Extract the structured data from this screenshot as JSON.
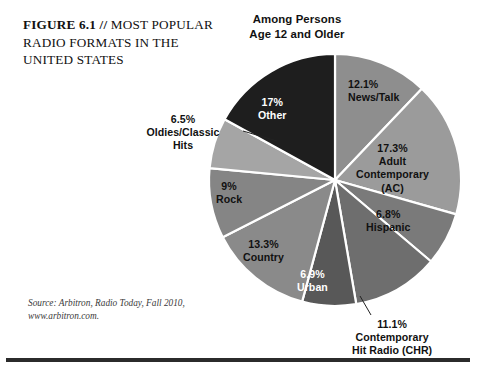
{
  "figure": {
    "title_lead": "FIGURE 6.1 // ",
    "title_rest": "MOST POPULAR RADIO FORMATS IN THE UNITED STATES",
    "subtitle": "Among Persons\nAge 12 and Older",
    "subtitle_line1": "Among Persons",
    "subtitle_line2": "Age 12 and Older",
    "source_line1": "Source: Arbitron, Radio Today, Fall 2010,",
    "source_line2": "www.arbitron.com."
  },
  "labels": {
    "newstalk_pct": "12.1%",
    "newstalk_name": "News/Talk",
    "ac_pct": "17.3%",
    "ac_name1": "Adult",
    "ac_name2": "Contemporary",
    "ac_name3": "(AC)",
    "hispanic_pct": "6.8%",
    "hispanic_name": "Hispanic",
    "chr_pct": "11.1%",
    "chr_name1": "Contemporary",
    "chr_name2": "Hit Radio (CHR)",
    "urban_pct": "6.9%",
    "urban_name": "Urban",
    "country_pct": "13.3%",
    "country_name": "Country",
    "rock_pct": "9%",
    "rock_name": "Rock",
    "oldies_pct": "6.5%",
    "oldies_name1": "Oldies/Classic",
    "oldies_name2": "Hits",
    "other_pct": "17%",
    "other_name": "Other"
  },
  "colors": {
    "slice_newstalk": "#8e8e8e",
    "slice_ac": "#9b9b9b",
    "slice_hispanic": "#7a7a7a",
    "slice_chr": "#6e6e6e",
    "slice_urban": "#585858",
    "slice_country": "#8a8a8a",
    "slice_rock": "#858585",
    "slice_oldies": "#a5a5a5",
    "slice_other": "#1e1e1e",
    "separator": "#ffffff",
    "rule": "#2b2b2b",
    "text": "#111111",
    "text_on_dark": "#ffffff"
  },
  "chart_data": {
    "type": "pie",
    "title": "FIGURE 6.1 // MOST POPULAR RADIO FORMATS IN THE UNITED STATES",
    "subtitle": "Among Persons Age 12 and Older",
    "unit": "percent",
    "start_angle_deg": 0,
    "direction": "clockwise",
    "center": [
      335,
      180
    ],
    "radius": 126,
    "legend": "none (direct slice labels)",
    "grid": false,
    "source": "Source: Arbitron, Radio Today, Fall 2010, www.arbitron.com.",
    "categories": [
      "News/Talk",
      "Adult Contemporary (AC)",
      "Hispanic",
      "Contemporary Hit Radio (CHR)",
      "Urban",
      "Country",
      "Rock",
      "Oldies/Classic Hits",
      "Other"
    ],
    "values": [
      12.1,
      17.3,
      6.8,
      11.1,
      6.9,
      13.3,
      9.0,
      6.5,
      17.0
    ],
    "slices": [
      {
        "name": "News/Talk",
        "value": 12.1,
        "label": "12.1%",
        "color": "#8e8e8e",
        "start_deg": 0.0,
        "end_deg": 43.56
      },
      {
        "name": "Adult Contemporary (AC)",
        "value": 17.3,
        "label": "17.3%",
        "color": "#9b9b9b",
        "start_deg": 43.56,
        "end_deg": 105.84
      },
      {
        "name": "Hispanic",
        "value": 6.8,
        "label": "6.8%",
        "color": "#7a7a7a",
        "start_deg": 105.84,
        "end_deg": 130.32
      },
      {
        "name": "Contemporary Hit Radio (CHR)",
        "value": 11.1,
        "label": "11.1%",
        "color": "#6e6e6e",
        "start_deg": 130.32,
        "end_deg": 170.28
      },
      {
        "name": "Urban",
        "value": 6.9,
        "label": "6.9%",
        "color": "#585858",
        "start_deg": 170.28,
        "end_deg": 195.12
      },
      {
        "name": "Country",
        "value": 13.3,
        "label": "13.3%",
        "color": "#8a8a8a",
        "start_deg": 195.12,
        "end_deg": 243.0
      },
      {
        "name": "Rock",
        "value": 9.0,
        "label": "9%",
        "color": "#858585",
        "start_deg": 243.0,
        "end_deg": 275.4
      },
      {
        "name": "Oldies/Classic Hits",
        "value": 6.5,
        "label": "6.5%",
        "color": "#a5a5a5",
        "start_deg": 275.4,
        "end_deg": 298.8
      },
      {
        "name": "Other",
        "value": 17.0,
        "label": "17%",
        "color": "#1e1e1e",
        "start_deg": 298.8,
        "end_deg": 360.0
      }
    ]
  }
}
